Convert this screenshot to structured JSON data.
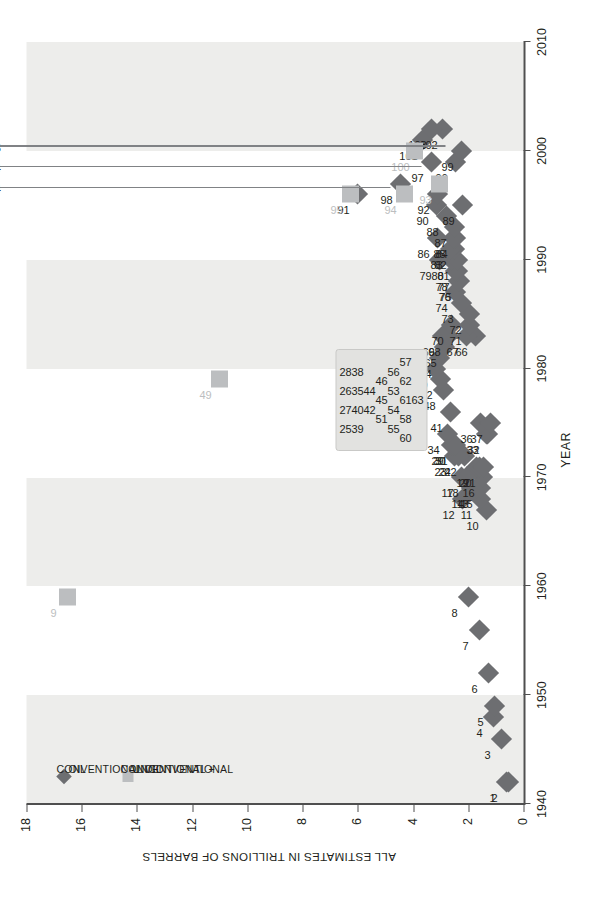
{
  "axes": {
    "x": {
      "title": "YEAR",
      "ticks": [
        1940,
        1950,
        1960,
        1970,
        1980,
        1990,
        2000,
        2010
      ],
      "min": 1940,
      "max": 2010
    },
    "y": {
      "title": "ALL ESTIMATES IN TRILLIONS OF BARRELS",
      "ticks": [
        0,
        2,
        4,
        6,
        8,
        10,
        12,
        14,
        16,
        18
      ],
      "min": 0,
      "max": 18
    }
  },
  "legend": {
    "items": [
      {
        "marker": "diamond",
        "label": "CONVENTIONAL\nOIL",
        "line1": "CONVENTIONAL",
        "line2": "OIL",
        "color": "#6d6e71"
      },
      {
        "marker": "square",
        "label": "CONVENTIONAL +\nUNCONVENTIONAL\nOIL",
        "line1": "CONVENTIONAL +",
        "line2": "UNCONVENTIONAL",
        "line3": "OIL",
        "color": "#bcbec0"
      }
    ]
  },
  "annotation": {
    "source_line1": "USGS",
    "source_line2": "WPA",
    "source_line3": "2000",
    "entries": [
      {
        "id": "98",
        "text": "98 = 4.44",
        "value": 4.44
      },
      {
        "id": "97",
        "text": "97 = 3.34",
        "value": 3.34
      },
      {
        "id": "96",
        "text": "96 = 2.45",
        "value": 2.45
      }
    ]
  },
  "blob": {
    "rows": [
      [
        "25",
        "27",
        "26",
        "28"
      ],
      [
        "39",
        "40",
        "35",
        "38"
      ],
      [
        "42",
        "44"
      ],
      [
        "51",
        "45",
        "46"
      ],
      [
        "55",
        "54",
        "53",
        "56"
      ],
      [
        "60",
        "58",
        "61",
        "62",
        "57"
      ],
      [
        "63"
      ]
    ]
  },
  "chart_data": {
    "type": "scatter",
    "title": "",
    "xlabel": "YEAR",
    "ylabel": "ALL ESTIMATES IN TRILLIONS OF BARRELS",
    "xlim": [
      1940,
      2010
    ],
    "ylim": [
      0,
      18
    ],
    "grid": false,
    "legend_position": "upper-left",
    "series": [
      {
        "name": "CONVENTIONAL OIL",
        "marker": "diamond",
        "color": "#6d6e71",
        "points": [
          {
            "id": 1,
            "x": 1942,
            "y": 0.6
          },
          {
            "id": 2,
            "x": 1942,
            "y": 0.55
          },
          {
            "id": 3,
            "x": 1946,
            "y": 0.8
          },
          {
            "id": 4,
            "x": 1948,
            "y": 1.1
          },
          {
            "id": 5,
            "x": 1949,
            "y": 1.05
          },
          {
            "id": 6,
            "x": 1952,
            "y": 1.25
          },
          {
            "id": 7,
            "x": 1956,
            "y": 1.6
          },
          {
            "id": 8,
            "x": 1959,
            "y": 2.0
          },
          {
            "id": 10,
            "x": 1967,
            "y": 1.35
          },
          {
            "id": 11,
            "x": 1968,
            "y": 1.55
          },
          {
            "id": 12,
            "x": 1968,
            "y": 2.2
          },
          {
            "id": 13,
            "x": 1969,
            "y": 1.7
          },
          {
            "id": 14,
            "x": 1969,
            "y": 1.9
          },
          {
            "id": 15,
            "x": 1969,
            "y": 1.55
          },
          {
            "id": 16,
            "x": 1970,
            "y": 1.5
          },
          {
            "id": 17,
            "x": 1970,
            "y": 2.25
          },
          {
            "id": 18,
            "x": 1970,
            "y": 2.05
          },
          {
            "id": 19,
            "x": 1971,
            "y": 1.7
          },
          {
            "id": 20,
            "x": 1971,
            "y": 1.6
          },
          {
            "id": 21,
            "x": 1971,
            "y": 1.45
          },
          {
            "id": 22,
            "x": 1972,
            "y": 2.15
          },
          {
            "id": 23,
            "x": 1972,
            "y": 2.5
          },
          {
            "id": 24,
            "x": 1972,
            "y": 2.35
          },
          {
            "id": 29,
            "x": 1973,
            "y": 2.6
          },
          {
            "id": 30,
            "x": 1973,
            "y": 2.55
          },
          {
            "id": 31,
            "x": 1973,
            "y": 2.45
          },
          {
            "id": 32,
            "x": 1974,
            "y": 1.3
          },
          {
            "id": 33,
            "x": 1974,
            "y": 1.35
          },
          {
            "id": 34,
            "x": 1974,
            "y": 2.75
          },
          {
            "id": 36,
            "x": 1975,
            "y": 1.55
          },
          {
            "id": 37,
            "x": 1975,
            "y": 1.2
          },
          {
            "id": 41,
            "x": 1976,
            "y": 2.65
          },
          {
            "id": 43,
            "x": 1977,
            "y": 5.2
          },
          {
            "id": 47,
            "x": 1978,
            "y": 5.55
          },
          {
            "id": 48,
            "x": 1978,
            "y": 2.9
          },
          {
            "id": 52,
            "x": 1979,
            "y": 3.0
          },
          {
            "id": 59,
            "x": 1980,
            "y": 3.2
          },
          {
            "id": 64,
            "x": 1981,
            "y": 3.05
          },
          {
            "id": 65,
            "x": 1982,
            "y": 2.85
          },
          {
            "id": 66,
            "x": 1983,
            "y": 1.75
          },
          {
            "id": 67,
            "x": 1983,
            "y": 2.05
          },
          {
            "id": 68,
            "x": 1983,
            "y": 2.7
          },
          {
            "id": 69,
            "x": 1983,
            "y": 2.95
          },
          {
            "id": 70,
            "x": 1984,
            "y": 2.6
          },
          {
            "id": 71,
            "x": 1984,
            "y": 1.95
          },
          {
            "id": 72,
            "x": 1985,
            "y": 1.95
          },
          {
            "id": 73,
            "x": 1986,
            "y": 2.25
          },
          {
            "id": 74,
            "x": 1987,
            "y": 2.45
          },
          {
            "id": 75,
            "x": 1988,
            "y": 2.3
          },
          {
            "id": 76,
            "x": 1988,
            "y": 2.35
          },
          {
            "id": 77,
            "x": 1989,
            "y": 2.4
          },
          {
            "id": 78,
            "x": 1989,
            "y": 2.45
          },
          {
            "id": 79,
            "x": 1990,
            "y": 3.05
          },
          {
            "id": 80,
            "x": 1990,
            "y": 2.6
          },
          {
            "id": 81,
            "x": 1990,
            "y": 2.4
          },
          {
            "id": 82,
            "x": 1991,
            "y": 2.5
          },
          {
            "id": 83,
            "x": 1991,
            "y": 2.65
          },
          {
            "id": 84,
            "x": 1992,
            "y": 2.45
          },
          {
            "id": 85,
            "x": 1992,
            "y": 2.55
          },
          {
            "id": 86,
            "x": 1992,
            "y": 3.1
          },
          {
            "id": 87,
            "x": 1993,
            "y": 2.5
          },
          {
            "id": 88,
            "x": 1994,
            "y": 2.8
          },
          {
            "id": 89,
            "x": 1995,
            "y": 2.2
          },
          {
            "id": 90,
            "x": 1995,
            "y": 3.15
          },
          {
            "id": 91,
            "x": 1996,
            "y": 6.0
          },
          {
            "id": 92,
            "x": 1996,
            "y": 3.1
          },
          {
            "id": 96,
            "x": 1999,
            "y": 2.45
          },
          {
            "id": 97,
            "x": 1999,
            "y": 3.34
          },
          {
            "id": 98,
            "x": 1997,
            "y": 4.44
          },
          {
            "id": 99,
            "x": 2000,
            "y": 2.25
          },
          {
            "id": 101,
            "x": 2001,
            "y": 3.65
          },
          {
            "id": 102,
            "x": 2002,
            "y": 2.95
          },
          {
            "id": 103,
            "x": 2002,
            "y": 3.35
          }
        ]
      },
      {
        "name": "CONVENTIONAL + UNCONVENTIONAL OIL",
        "marker": "square",
        "color": "#bcbec0",
        "points": [
          {
            "id": 9,
            "x": 1959,
            "y": 16.5
          },
          {
            "id": 49,
            "x": 1979,
            "y": 11.0
          },
          {
            "id": 93,
            "x": 1997,
            "y": 3.05
          },
          {
            "id": 94,
            "x": 1996,
            "y": 4.3
          },
          {
            "id": 95,
            "x": 1996,
            "y": 6.25
          },
          {
            "id": 100,
            "x": 2000,
            "y": 3.95
          }
        ]
      }
    ],
    "grouped_cluster": {
      "note": "overlapping estimates 1972-1981 drawn inside a shaded callout blob",
      "ids": [
        25,
        26,
        27,
        28,
        35,
        38,
        39,
        40,
        42,
        44,
        45,
        46,
        51,
        53,
        54,
        55,
        56,
        57,
        58,
        60,
        61,
        62,
        63
      ]
    }
  }
}
